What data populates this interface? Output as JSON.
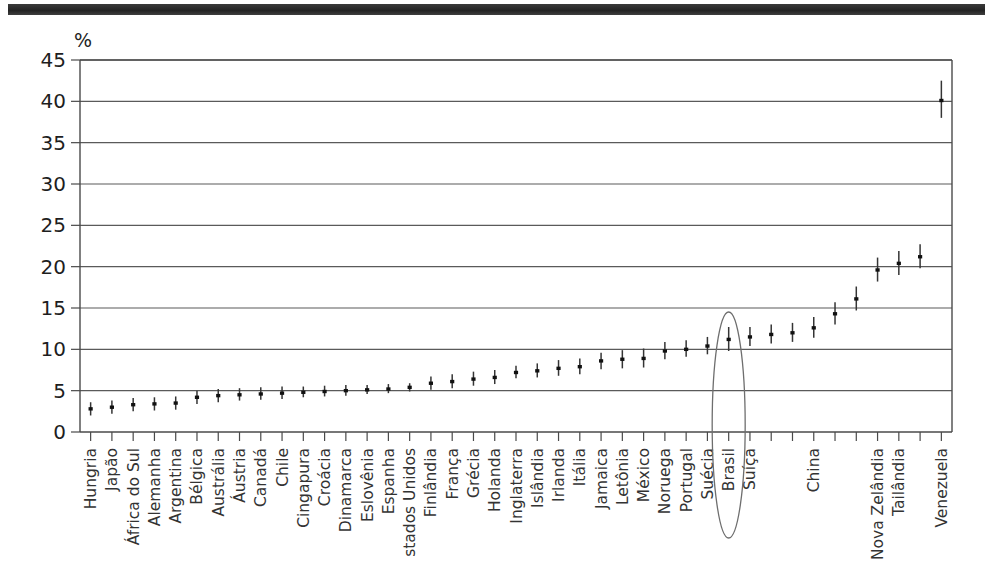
{
  "figure": {
    "unit_label": "%",
    "highlight": {
      "name": "highlight-ellipse",
      "target": "Brasil"
    }
  },
  "chart_data": {
    "type": "scatter",
    "title": "",
    "subtitle": "",
    "xlabel": "",
    "ylabel": "%",
    "ylim": [
      0,
      45
    ],
    "ytick_labels": [
      "0",
      "5",
      "10",
      "15",
      "20",
      "25",
      "30",
      "35",
      "40",
      "45"
    ],
    "ytick_values": [
      0,
      5,
      10,
      15,
      20,
      25,
      30,
      35,
      40,
      45
    ],
    "grid": "horizontal",
    "legend": "none",
    "marker_style": "point-with-confidence-interval",
    "highlighted_category": "Brasil",
    "categories": [
      "Hungria",
      "Japão",
      "África do Sul",
      "Alemanha",
      "Argentina",
      "Bélgica",
      "Austrália",
      "Áustria",
      "Canadá",
      "Chile",
      "Cingapura",
      "Croácia",
      "Dinamarca",
      "Eslovênia",
      "Espanha",
      "stados Unidos",
      "Finlândia",
      "França",
      "Grécia",
      "Holanda",
      "Inglaterra",
      "Islândia",
      "Irlanda",
      "Itália",
      "Jamaica",
      "Letônia",
      "México",
      "Noruega",
      "Portugal",
      "Suécia",
      "Brasil",
      "Suíça",
      "",
      "",
      "China",
      "",
      "",
      "Nova Zelândia",
      "Tailândia",
      "",
      "Venezuela"
    ],
    "values": [
      2.8,
      3.0,
      3.3,
      3.4,
      3.5,
      4.2,
      4.4,
      4.5,
      4.6,
      4.7,
      4.8,
      4.9,
      5.0,
      5.1,
      5.2,
      5.4,
      5.9,
      6.1,
      6.4,
      6.6,
      7.2,
      7.4,
      7.7,
      7.9,
      8.6,
      8.8,
      8.9,
      9.8,
      10.0,
      10.4,
      11.2,
      11.5,
      11.8,
      12.0,
      12.6,
      14.3,
      16.1,
      19.6,
      20.4,
      21.2,
      40.1
    ],
    "ci_low": [
      2.0,
      2.2,
      2.5,
      2.6,
      2.7,
      3.4,
      3.6,
      3.8,
      3.9,
      4.0,
      4.2,
      4.3,
      4.4,
      4.6,
      4.7,
      4.9,
      5.1,
      5.3,
      5.6,
      5.8,
      6.5,
      6.6,
      6.8,
      7.0,
      7.6,
      7.7,
      7.8,
      8.8,
      9.1,
      9.4,
      9.8,
      10.4,
      10.7,
      10.9,
      11.4,
      13.0,
      14.7,
      18.2,
      19.0,
      19.8,
      38.0
    ],
    "ci_high": [
      3.6,
      3.8,
      4.1,
      4.2,
      4.3,
      5.0,
      5.2,
      5.3,
      5.4,
      5.5,
      5.5,
      5.6,
      5.7,
      5.7,
      5.8,
      5.9,
      6.7,
      7.0,
      7.3,
      7.5,
      8.0,
      8.3,
      8.7,
      8.9,
      9.6,
      9.9,
      10.1,
      10.9,
      11.1,
      11.5,
      12.7,
      12.7,
      13.0,
      13.2,
      13.9,
      15.7,
      17.6,
      21.1,
      21.9,
      22.7,
      42.5
    ]
  }
}
